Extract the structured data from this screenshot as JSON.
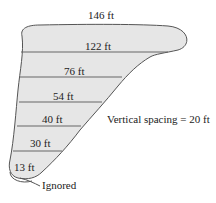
{
  "diagram": {
    "widths": [
      {
        "label": "146 ft",
        "value": 146
      },
      {
        "label": "122 ft",
        "value": 122
      },
      {
        "label": "76 ft",
        "value": 76
      },
      {
        "label": "54 ft",
        "value": 54
      },
      {
        "label": "40 ft",
        "value": 40
      },
      {
        "label": "30 ft",
        "value": 30
      },
      {
        "label": "13 ft",
        "value": 13
      }
    ],
    "annotation": "Vertical spacing = 20 ft",
    "ignored_label": "Ignored",
    "colors": {
      "fill": "#e6e6e6",
      "stroke": "#555555",
      "text": "#222222"
    }
  }
}
